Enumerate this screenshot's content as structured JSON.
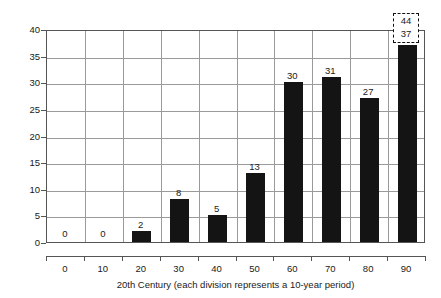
{
  "chart_data": {
    "type": "bar",
    "title": "",
    "xlabel": "20th Century (each division represents a 10-year period)",
    "ylabel": "Count of high water episodes over 1.10m",
    "categories": [
      "0",
      "10",
      "20",
      "30",
      "40",
      "50",
      "60",
      "70",
      "80",
      "90"
    ],
    "values": [
      0,
      0,
      2,
      8,
      5,
      13,
      30,
      31,
      27,
      37
    ],
    "data_labels": [
      "0",
      "0",
      "2",
      "8",
      "5",
      "13",
      "30",
      "31",
      "27",
      "37"
    ],
    "ylim": [
      0,
      40
    ],
    "yticks": [
      0,
      5,
      10,
      15,
      20,
      25,
      30,
      35,
      40
    ],
    "ytick_labels": [
      "0",
      "5",
      "10",
      "15",
      "20",
      "25",
      "30",
      "35",
      "40"
    ],
    "grid": true,
    "legend": "none",
    "bar_color": "#141414",
    "annotations": [
      {
        "name": "decade-90-callout",
        "category": "90",
        "upper_value": "44",
        "lower_value": "37",
        "style": "dashed-box"
      }
    ]
  }
}
